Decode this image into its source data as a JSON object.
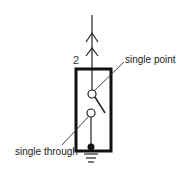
{
  "diagram": {
    "type": "switch-schematic",
    "terminal_number": "2",
    "labels": {
      "single_point": "single point",
      "single_through": "single through"
    },
    "elements": [
      "double-chevron-terminal",
      "switch-box",
      "switch-contact-upper",
      "switch-contact-lower",
      "switch-blade",
      "ground-symbol"
    ],
    "colors": {
      "stroke": "#111111",
      "text": "#222222",
      "background": "#ffffff"
    }
  }
}
